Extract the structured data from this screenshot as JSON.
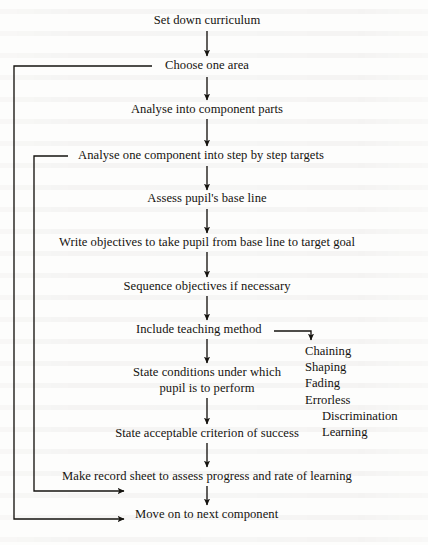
{
  "diagram": {
    "type": "flowchart",
    "title": "Set down curriculum",
    "nodes": [
      {
        "id": "set-down-curriculum",
        "label": "Set down curriculum"
      },
      {
        "id": "choose-one-area",
        "label": "Choose one area"
      },
      {
        "id": "analyse-into-component-parts",
        "label": "Analyse into component parts"
      },
      {
        "id": "analyse-one-component",
        "label": "Analyse one component into step by step targets"
      },
      {
        "id": "assess-base-line",
        "label": "Assess pupil's base line"
      },
      {
        "id": "write-objectives",
        "label": "Write objectives to take pupil from base line to target goal"
      },
      {
        "id": "sequence-objectives",
        "label": "Sequence objectives if necessary"
      },
      {
        "id": "include-teaching-method",
        "label": "Include teaching method"
      },
      {
        "id": "state-conditions-line1",
        "label": "State conditions under which"
      },
      {
        "id": "state-conditions-line2",
        "label": "pupil is to perform"
      },
      {
        "id": "state-criterion",
        "label": "State acceptable criterion of success"
      },
      {
        "id": "make-record-sheet",
        "label": "Make record sheet to assess progress and rate of learning"
      },
      {
        "id": "move-on-next-component",
        "label": "Move on to next component"
      }
    ],
    "branch": {
      "source": "include-teaching-method",
      "items": [
        {
          "label": "Chaining",
          "indent": false
        },
        {
          "label": "Shaping",
          "indent": false
        },
        {
          "label": "Fading",
          "indent": false
        },
        {
          "label": "Errorless",
          "indent": false
        },
        {
          "label": "Discrimination",
          "indent": true
        },
        {
          "label": "Learning",
          "indent": true
        }
      ]
    },
    "feedback_loops": [
      {
        "id": "outer-loop",
        "from": "move-on-next-component",
        "to": "choose-one-area"
      },
      {
        "id": "inner-loop",
        "from": "move-on-next-component",
        "to": "analyse-one-component"
      }
    ],
    "colors": {
      "ink": "#15130f",
      "paper": "#fdfdfc"
    }
  }
}
